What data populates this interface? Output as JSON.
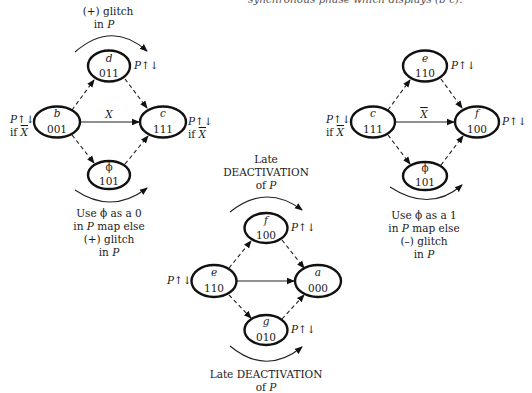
{
  "caption_top": "synchronous phase which displays (b-c).",
  "diagrams": {
    "left": {
      "top_note": [
        "(+) glitch",
        "in P"
      ],
      "bottom_note": [
        "Use ϕ as a 0",
        "in P map else",
        "(+) glitch",
        "in P"
      ],
      "nodes": {
        "b": {
          "name": "b",
          "code": "001",
          "label": "P↑↓",
          "cond": "if X̄"
        },
        "d": {
          "name": "d",
          "code": "011",
          "label": "P↑↓"
        },
        "c": {
          "name": "c",
          "code": "111",
          "label": "P↑↓",
          "cond": "if X̄"
        },
        "phi": {
          "name": "ϕ",
          "code": "101"
        }
      },
      "edge_label": "X"
    },
    "right": {
      "bottom_note": [
        "Use ϕ as a 1",
        "in P map else",
        "(–) glitch",
        "in P"
      ],
      "nodes": {
        "c": {
          "name": "c",
          "code": "111",
          "label": "P↑↓",
          "cond": "if X̄"
        },
        "e": {
          "name": "e",
          "code": "110",
          "label": "P↑↓"
        },
        "f": {
          "name": "f",
          "code": "100",
          "label": "P↑↓"
        },
        "phi": {
          "name": "ϕ",
          "code": "101"
        }
      },
      "edge_label": "X̄"
    },
    "bottom": {
      "top_note": [
        "Late",
        "DEACTIVATION",
        "of P"
      ],
      "bottom_note": [
        "Late DEACTIVATION",
        "of P"
      ],
      "nodes": {
        "e": {
          "name": "e",
          "code": "110",
          "label": "P↑↓"
        },
        "f": {
          "name": "f",
          "code": "100",
          "label": "P↑↓"
        },
        "a": {
          "name": "a",
          "code": "000"
        },
        "g": {
          "name": "g",
          "code": "010",
          "label": "P↑↓"
        }
      }
    }
  }
}
